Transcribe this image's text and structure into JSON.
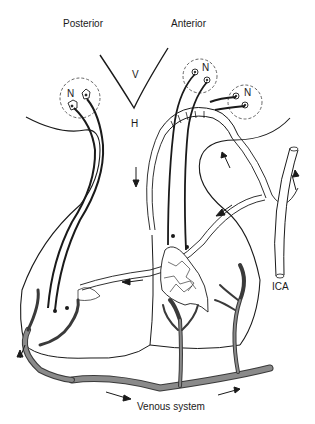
{
  "diagram": {
    "type": "anatomical-schematic",
    "labels": {
      "posterior": "Posterior",
      "anterior": "Anterior",
      "ventricle": "V",
      "hypothalamus": "H",
      "nucleus_left": "N",
      "nucleus_right_top": "N",
      "nucleus_right_side": "N",
      "ica": "ICA",
      "venous_system": "Venous system"
    },
    "colors": {
      "line": "#1a1a1a",
      "vein_fill": "#8a8a8a",
      "vein_edge": "#3a3a3a",
      "background": "#ffffff",
      "dashed_circle": "#555555"
    }
  }
}
